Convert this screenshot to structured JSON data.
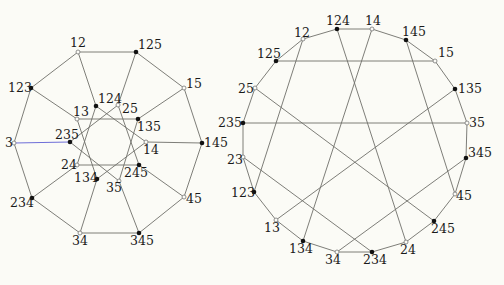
{
  "colors": {
    "background": "#fbfbf6",
    "edge": "#6f6f6a",
    "highlight_edge": "#6f6fd8",
    "filled_vertex": "#111111"
  },
  "graphs": [
    {
      "name": "left-graph",
      "vertices": [
        {
          "id": "12",
          "x": 78,
          "y": 52,
          "filled": false,
          "lx": 70,
          "ly": 47
        },
        {
          "id": "125",
          "x": 136,
          "y": 52,
          "filled": true,
          "lx": 138,
          "ly": 49
        },
        {
          "id": "15",
          "x": 184,
          "y": 88,
          "filled": false,
          "lx": 186,
          "ly": 88
        },
        {
          "id": "145",
          "x": 202,
          "y": 143,
          "filled": true,
          "lx": 204,
          "ly": 147
        },
        {
          "id": "45",
          "x": 184,
          "y": 197,
          "filled": false,
          "lx": 186,
          "ly": 203
        },
        {
          "id": "345",
          "x": 139,
          "y": 233,
          "filled": true,
          "lx": 130,
          "ly": 245
        },
        {
          "id": "34",
          "x": 80,
          "y": 233,
          "filled": false,
          "lx": 72,
          "ly": 245
        },
        {
          "id": "234",
          "x": 32,
          "y": 198,
          "filled": true,
          "lx": 10,
          "ly": 207
        },
        {
          "id": "3",
          "x": 14,
          "y": 143,
          "filled": false,
          "lx": 5,
          "ly": 147
        },
        {
          "id": "123",
          "x": 31,
          "y": 88,
          "filled": true,
          "lx": 8,
          "ly": 92
        },
        {
          "id": "124",
          "x": 96,
          "y": 106,
          "filled": true,
          "lx": 98,
          "ly": 103
        },
        {
          "id": "25",
          "x": 118,
          "y": 105,
          "filled": false,
          "lx": 122,
          "ly": 113
        },
        {
          "id": "135",
          "x": 138,
          "y": 119,
          "filled": true,
          "lx": 137,
          "ly": 131
        },
        {
          "id": "14",
          "x": 146,
          "y": 142,
          "filled": false,
          "lx": 143,
          "ly": 154
        },
        {
          "id": "245",
          "x": 139,
          "y": 165,
          "filled": true,
          "lx": 124,
          "ly": 177
        },
        {
          "id": "35",
          "x": 119,
          "y": 181,
          "filled": false,
          "lx": 106,
          "ly": 192
        },
        {
          "id": "134",
          "x": 97,
          "y": 179,
          "filled": true,
          "lx": 74,
          "ly": 182
        },
        {
          "id": "24",
          "x": 77,
          "y": 165,
          "filled": false,
          "lx": 61,
          "ly": 169
        },
        {
          "id": "235",
          "x": 70,
          "y": 142,
          "filled": true,
          "lx": 55,
          "ly": 139
        },
        {
          "id": "13",
          "x": 77,
          "y": 119,
          "filled": false,
          "lx": 73,
          "ly": 116
        }
      ],
      "edges": [
        [
          "12",
          "125"
        ],
        [
          "125",
          "15"
        ],
        [
          "15",
          "145"
        ],
        [
          "145",
          "45"
        ],
        [
          "45",
          "345"
        ],
        [
          "345",
          "34"
        ],
        [
          "34",
          "234"
        ],
        [
          "234",
          "3"
        ],
        [
          "3",
          "123"
        ],
        [
          "123",
          "12"
        ],
        [
          "12",
          "124"
        ],
        [
          "125",
          "25"
        ],
        [
          "15",
          "135"
        ],
        [
          "145",
          "14"
        ],
        [
          "45",
          "245"
        ],
        [
          "345",
          "35"
        ],
        [
          "34",
          "134"
        ],
        [
          "234",
          "24"
        ],
        [
          "3",
          "235"
        ],
        [
          "123",
          "13"
        ],
        [
          "124",
          "14"
        ],
        [
          "25",
          "245"
        ],
        [
          "135",
          "35"
        ],
        [
          "14",
          "134"
        ],
        [
          "245",
          "24"
        ],
        [
          "35",
          "235"
        ],
        [
          "134",
          "13"
        ],
        [
          "24",
          "124"
        ],
        [
          "235",
          "25"
        ],
        [
          "13",
          "135"
        ]
      ],
      "highlight_edges": [
        [
          "3",
          "235"
        ]
      ]
    },
    {
      "name": "right-graph",
      "vertices": [
        {
          "id": "124",
          "x": 337,
          "y": 29,
          "filled": true,
          "lx": 326,
          "ly": 25
        },
        {
          "id": "14",
          "x": 372,
          "y": 29,
          "filled": false,
          "lx": 365,
          "ly": 25
        },
        {
          "id": "145",
          "x": 406,
          "y": 40,
          "filled": true,
          "lx": 402,
          "ly": 36
        },
        {
          "id": "15",
          "x": 435,
          "y": 61,
          "filled": false,
          "lx": 438,
          "ly": 57
        },
        {
          "id": "135",
          "x": 455,
          "y": 89,
          "filled": true,
          "lx": 458,
          "ly": 93
        },
        {
          "id": "35",
          "x": 467,
          "y": 123,
          "filled": false,
          "lx": 469,
          "ly": 127
        },
        {
          "id": "345",
          "x": 466,
          "y": 158,
          "filled": true,
          "lx": 468,
          "ly": 157
        },
        {
          "id": "45",
          "x": 455,
          "y": 194,
          "filled": false,
          "lx": 456,
          "ly": 200
        },
        {
          "id": "245",
          "x": 434,
          "y": 221,
          "filled": true,
          "lx": 431,
          "ly": 233
        },
        {
          "id": "24",
          "x": 406,
          "y": 242,
          "filled": false,
          "lx": 400,
          "ly": 254
        },
        {
          "id": "234",
          "x": 372,
          "y": 252,
          "filled": true,
          "lx": 363,
          "ly": 264
        },
        {
          "id": "34",
          "x": 337,
          "y": 252,
          "filled": false,
          "lx": 325,
          "ly": 264
        },
        {
          "id": "134",
          "x": 303,
          "y": 241,
          "filled": true,
          "lx": 289,
          "ly": 253
        },
        {
          "id": "13",
          "x": 276,
          "y": 220,
          "filled": false,
          "lx": 264,
          "ly": 232
        },
        {
          "id": "123",
          "x": 254,
          "y": 192,
          "filled": true,
          "lx": 231,
          "ly": 197
        },
        {
          "id": "23",
          "x": 243,
          "y": 157,
          "filled": false,
          "lx": 227,
          "ly": 164
        },
        {
          "id": "235",
          "x": 243,
          "y": 123,
          "filled": true,
          "lx": 218,
          "ly": 127
        },
        {
          "id": "25",
          "x": 255,
          "y": 88,
          "filled": false,
          "lx": 238,
          "ly": 93
        },
        {
          "id": "125",
          "x": 276,
          "y": 61,
          "filled": true,
          "lx": 257,
          "ly": 58
        },
        {
          "id": "12",
          "x": 303,
          "y": 39,
          "filled": false,
          "lx": 294,
          "ly": 37
        }
      ],
      "edges": [
        [
          "124",
          "14"
        ],
        [
          "14",
          "145"
        ],
        [
          "145",
          "15"
        ],
        [
          "15",
          "135"
        ],
        [
          "135",
          "35"
        ],
        [
          "35",
          "345"
        ],
        [
          "345",
          "45"
        ],
        [
          "45",
          "245"
        ],
        [
          "245",
          "24"
        ],
        [
          "24",
          "234"
        ],
        [
          "234",
          "34"
        ],
        [
          "34",
          "134"
        ],
        [
          "134",
          "13"
        ],
        [
          "13",
          "123"
        ],
        [
          "123",
          "23"
        ],
        [
          "23",
          "235"
        ],
        [
          "235",
          "25"
        ],
        [
          "25",
          "125"
        ],
        [
          "125",
          "12"
        ],
        [
          "12",
          "124"
        ],
        [
          "125",
          "15"
        ],
        [
          "235",
          "35"
        ],
        [
          "12",
          "123"
        ],
        [
          "124",
          "24"
        ],
        [
          "14",
          "134"
        ],
        [
          "145",
          "45"
        ],
        [
          "25",
          "245"
        ],
        [
          "135",
          "13"
        ],
        [
          "23",
          "234"
        ],
        [
          "345",
          "34"
        ]
      ],
      "highlight_edges": []
    }
  ]
}
